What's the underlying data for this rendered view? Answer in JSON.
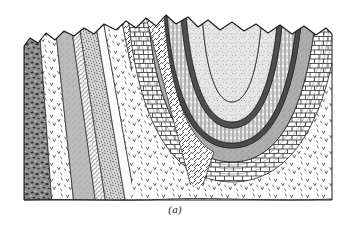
{
  "figure": {
    "label": "(a)",
    "background_color": "#ffffff",
    "ink_color": "#1a1a1a",
    "structure_type": "syncline",
    "view": "block-diagram",
    "block_bounds": {
      "left": 24,
      "right": 332,
      "top": 14,
      "bottom": 200
    }
  },
  "surface": {
    "name": "eroded-topographic-surface",
    "description": "Irregular ridge-and-valley erosion profile across the top of the block"
  },
  "units": [
    {
      "id": "u-basement",
      "name": "basement-igneous",
      "pattern": "scattered-v-marks",
      "fill": "#ffffff",
      "ink": "#3a3a3a",
      "position": "lower-block and far-left flank"
    },
    {
      "id": "u-dark-mottled",
      "name": "dark-mottled-unit",
      "pattern": "mottled-dark",
      "fill": "#8d8d8d",
      "ink": "#2b2b2b",
      "position": "far-left edge"
    },
    {
      "id": "u-gray-band-1",
      "name": "gray-sandstone-band",
      "pattern": "solid-gray",
      "fill": "#b9b9b9",
      "ink": "#2b2b2b",
      "position": "left limb"
    },
    {
      "id": "u-stipple-dense",
      "name": "dense-stipple-sandstone",
      "pattern": "dense-stipple",
      "fill": "#cfcfcf",
      "ink": "#2b2b2b",
      "position": "left limb"
    },
    {
      "id": "u-diagonal-hatch",
      "name": "diagonal-hatch-shale",
      "pattern": "diagonal-hatch",
      "fill": "#ffffff",
      "ink": "#2b2b2b",
      "position": "left limb and left fold flank"
    },
    {
      "id": "u-dark-marker",
      "name": "dark-marker-bed",
      "pattern": "solid-dark",
      "fill": "#4a4a4a",
      "ink": "#1a1a1a",
      "position": "repeated thin beds wrapping the fold"
    },
    {
      "id": "u-vertical-lines",
      "name": "vertical-line-siltstone",
      "pattern": "vertical-lines",
      "fill": "#ffffff",
      "ink": "#2b2b2b",
      "position": "inner fold limb"
    },
    {
      "id": "u-light-stipple",
      "name": "light-stipple-core",
      "pattern": "light-stipple",
      "fill": "#e2e2e2",
      "ink": "#5a5a5a",
      "position": "syncline core"
    },
    {
      "id": "u-brick",
      "name": "brick-limestone",
      "pattern": "brick",
      "fill": "#ffffff",
      "ink": "#2b2b2b",
      "position": "outer fold, lower right"
    },
    {
      "id": "u-gray-band-2",
      "name": "gray-shale-band",
      "pattern": "solid-gray",
      "fill": "#adadad",
      "ink": "#2b2b2b",
      "position": "fold limb, outer wrap"
    }
  ],
  "annotations": {
    "fold_axis_note": "U-shaped fold closure opens upward toward the eroded surface",
    "left_limb_dip": "steep, dipping to the right",
    "right_limb_dip": "steep, dipping to the left"
  }
}
